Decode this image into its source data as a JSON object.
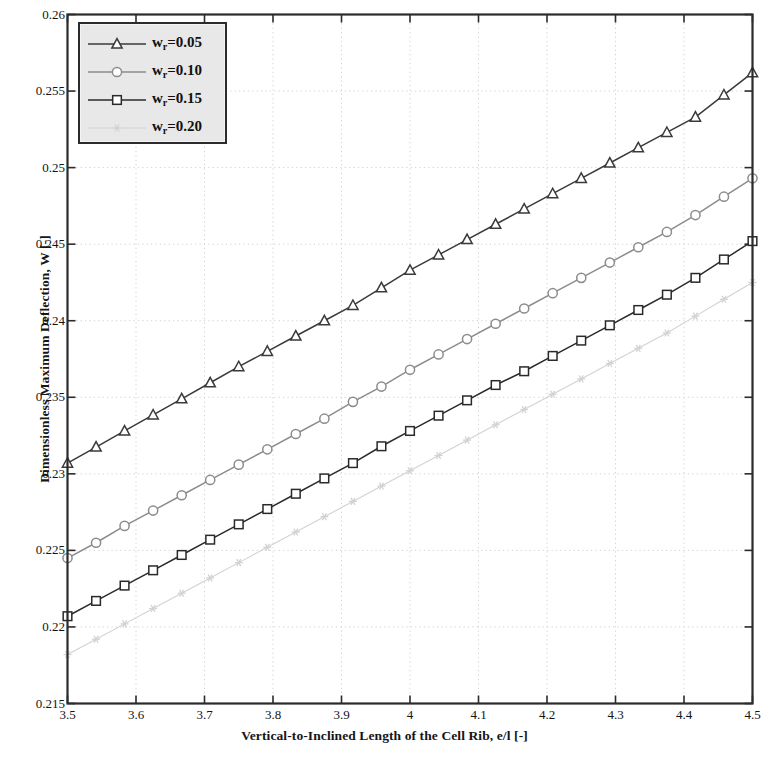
{
  "chart_data": {
    "type": "line",
    "title": "",
    "xlabel": "Vertical-to-Inclined Length of the Cell Rib, e/l [-]",
    "ylabel": "Dimensionless Maximum Deflection, W [-]",
    "xlim": [
      3.5,
      4.5
    ],
    "ylim": [
      0.215,
      0.26
    ],
    "xticks": [
      "3.5",
      "3.6",
      "3.7",
      "3.8",
      "3.9",
      "4",
      "4.1",
      "4.2",
      "4.3",
      "4.4",
      "4.5"
    ],
    "xtick_values": [
      3.5,
      3.6,
      3.7,
      3.8,
      3.9,
      4.0,
      4.1,
      4.2,
      4.3,
      4.4,
      4.5
    ],
    "yticks": [
      "0.215",
      "0.22",
      "0.225",
      "0.23",
      "0.235",
      "0.24",
      "0.245",
      "0.25",
      "0.255",
      "0.26"
    ],
    "ytick_values": [
      0.215,
      0.22,
      0.225,
      0.23,
      0.235,
      0.24,
      0.245,
      0.25,
      0.255,
      0.26
    ],
    "grid": true,
    "legend_position": "upper left",
    "x": [
      3.5,
      3.5417,
      3.5833,
      3.625,
      3.6667,
      3.7083,
      3.75,
      3.7917,
      3.8333,
      3.875,
      3.9167,
      3.9583,
      4.0,
      4.0417,
      4.0833,
      4.125,
      4.1667,
      4.2083,
      4.25,
      4.2917,
      4.3333,
      4.375,
      4.4167,
      4.4583,
      4.5
    ],
    "series": [
      {
        "name": "w_r=0.05",
        "label": "w",
        "sub": "r",
        "label_rest": "=0.05",
        "marker": "triangle",
        "color": "#3a3a3a",
        "values": [
          0.2307,
          0.23175,
          0.2328,
          0.23385,
          0.2349,
          0.23595,
          0.237,
          0.238,
          0.239,
          0.24,
          0.241,
          0.24215,
          0.2433,
          0.2443,
          0.2453,
          0.2463,
          0.2473,
          0.2483,
          0.2493,
          0.2503,
          0.2513,
          0.2523,
          0.2533,
          0.25475,
          0.2562
        ]
      },
      {
        "name": "w_r=0.10",
        "label": "w",
        "sub": "r",
        "label_rest": "=0.10",
        "marker": "circle",
        "color": "#8c8c8c",
        "values": [
          0.2245,
          0.2255,
          0.2266,
          0.2276,
          0.2286,
          0.2296,
          0.2306,
          0.2316,
          0.2326,
          0.2336,
          0.2347,
          0.2357,
          0.2368,
          0.2378,
          0.2388,
          0.2398,
          0.2408,
          0.2418,
          0.2428,
          0.2438,
          0.2448,
          0.2458,
          0.2469,
          0.2481,
          0.2493
        ]
      },
      {
        "name": "w_r=0.15",
        "label": "w",
        "sub": "r",
        "label_rest": "=0.15",
        "marker": "square",
        "color": "#2a2a2a",
        "values": [
          0.2207,
          0.2217,
          0.2227,
          0.2237,
          0.2247,
          0.2257,
          0.2267,
          0.2277,
          0.2287,
          0.2297,
          0.2307,
          0.2318,
          0.2328,
          0.2338,
          0.2348,
          0.2358,
          0.2367,
          0.2377,
          0.2387,
          0.2397,
          0.2407,
          0.2417,
          0.2428,
          0.244,
          0.2452
        ]
      },
      {
        "name": "w_r=0.20",
        "label": "w",
        "sub": "r",
        "label_rest": "=0.20",
        "marker": "star",
        "color": "#d2d2d2",
        "values": [
          0.2182,
          0.2192,
          0.2202,
          0.2212,
          0.2222,
          0.2232,
          0.2242,
          0.2252,
          0.2262,
          0.2272,
          0.2282,
          0.2292,
          0.2302,
          0.2312,
          0.2322,
          0.2332,
          0.2342,
          0.2352,
          0.2362,
          0.2372,
          0.2382,
          0.2392,
          0.2403,
          0.2414,
          0.2425
        ]
      }
    ]
  },
  "legend": {
    "entries": [
      {
        "label": "w",
        "sub": "r",
        "rest": "=0.05"
      },
      {
        "label": "w",
        "sub": "r",
        "rest": "=0.10"
      },
      {
        "label": "w",
        "sub": "r",
        "rest": "=0.15"
      },
      {
        "label": "w",
        "sub": "r",
        "rest": "=0.20"
      }
    ]
  }
}
